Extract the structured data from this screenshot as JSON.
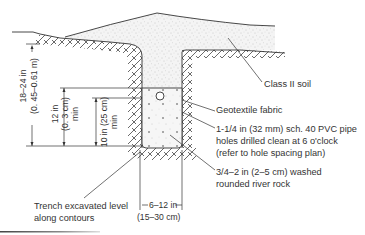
{
  "diagram": {
    "type": "trench cross-section",
    "labels": {
      "soil": "Class II soil",
      "fabric": "Geotextile fabric",
      "pipe_line1": "1-1/4 in (32 mm) sch. 40 PVC pipe",
      "pipe_line2": "holes drilled clean at 6 o'clock",
      "pipe_line3": "(refer to hole spacing plan)",
      "rock_line1": "3/4–2 in (2–5 cm) washed",
      "rock_line2": "rounded river rock",
      "trench_line1": "Trench excavated level",
      "trench_line2": "along contours"
    },
    "dimensions": {
      "total_depth_line1": "18–24 in",
      "total_depth_line2": "(0. 45–0.61 m)",
      "cover_line1": "12 in",
      "cover_line2": "(0. 3 cm)",
      "cover_line3": "min",
      "rock_depth_line1": "10 in (25 cm)",
      "rock_depth_line2": "min",
      "width_line1": "6–12 in",
      "width_line2": "(15–30 cm)"
    },
    "colors": {
      "line": "#333333",
      "stipple": "#9a9a9a",
      "footer_bar": "#555555"
    }
  }
}
